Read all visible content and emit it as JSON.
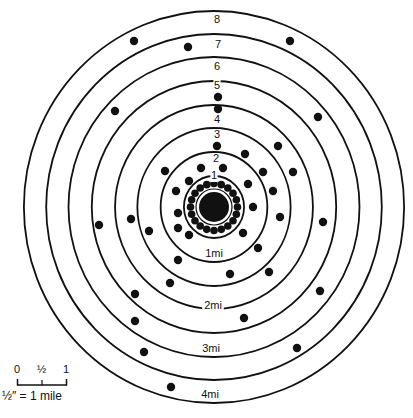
{
  "diagram": {
    "center": [
      214,
      207
    ],
    "ring_radii": [
      31,
      55,
      79,
      102,
      126,
      150,
      173,
      196
    ],
    "x_scale": 0.97,
    "ring_number_labels": [
      {
        "text": "1",
        "x": 214,
        "y": 176
      },
      {
        "text": "2",
        "x": 216,
        "y": 159
      },
      {
        "text": "3",
        "x": 217,
        "y": 135
      },
      {
        "text": "4",
        "x": 217,
        "y": 120
      },
      {
        "text": "5",
        "x": 217,
        "y": 86
      },
      {
        "text": "6",
        "x": 217,
        "y": 67
      },
      {
        "text": "7",
        "x": 218,
        "y": 45
      },
      {
        "text": "8",
        "x": 217,
        "y": 20
      }
    ],
    "distance_labels": [
      {
        "text": "1mi",
        "x": 214,
        "y": 254
      },
      {
        "text": "2mi",
        "x": 213,
        "y": 306
      },
      {
        "text": "3mi",
        "x": 211,
        "y": 349
      },
      {
        "text": "4mi",
        "x": 210,
        "y": 395
      }
    ],
    "dots": [
      [
        134,
        41
      ],
      [
        188,
        47
      ],
      [
        290,
        41
      ],
      [
        115,
        111
      ],
      [
        218,
        97
      ],
      [
        218,
        109
      ],
      [
        318,
        117
      ],
      [
        217,
        146
      ],
      [
        278,
        146
      ],
      [
        245,
        154
      ],
      [
        165,
        171
      ],
      [
        201,
        168
      ],
      [
        223,
        168
      ],
      [
        263,
        172
      ],
      [
        293,
        172
      ],
      [
        189,
        181
      ],
      [
        248,
        184
      ],
      [
        176,
        191
      ],
      [
        273,
        191
      ],
      [
        99,
        225
      ],
      [
        131,
        219
      ],
      [
        149,
        231
      ],
      [
        178,
        213
      ],
      [
        178,
        228
      ],
      [
        189,
        235
      ],
      [
        178,
        260
      ],
      [
        253,
        207
      ],
      [
        280,
        217
      ],
      [
        323,
        222
      ],
      [
        243,
        233
      ],
      [
        258,
        248
      ],
      [
        230,
        274
      ],
      [
        269,
        272
      ],
      [
        170,
        283
      ],
      [
        135,
        294
      ],
      [
        320,
        291
      ],
      [
        244,
        318
      ],
      [
        135,
        321
      ],
      [
        297,
        348
      ],
      [
        144,
        352
      ],
      [
        171,
        387
      ]
    ],
    "core": {
      "blob_radius": 15,
      "inner_circle_radius": 18,
      "dot_ring_radius": 23.5,
      "dot_count": 20,
      "dot_radius": 3.8
    }
  },
  "scale_bar": {
    "ticks": [
      "0",
      "½",
      "1"
    ],
    "caption": "½″ = 1 mile"
  }
}
